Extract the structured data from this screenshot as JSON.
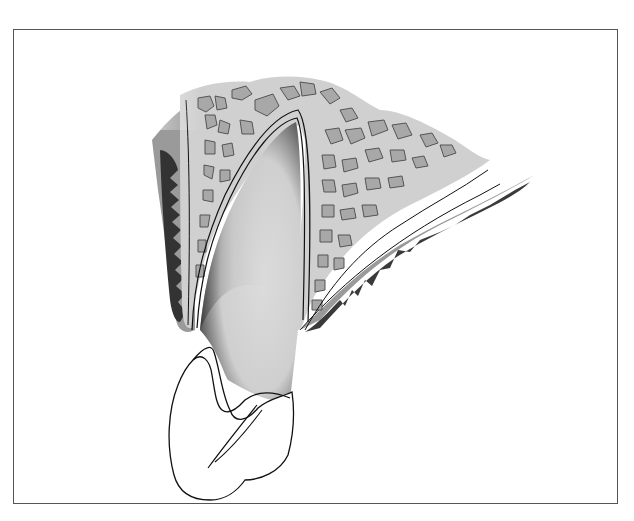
{
  "figure": {
    "labels": [],
    "colors": {
      "frame": "#555555",
      "background": "#ffffff",
      "soft_tissue_dark": "#3a3a3a",
      "soft_tissue_mid": "#9a9a9a",
      "bone_matrix": "#cfcfcf",
      "marrow_spaces": "#a9a9a9",
      "root": "#d4d4d4",
      "crown": "#ffffff",
      "outline": "#111111"
    }
  }
}
